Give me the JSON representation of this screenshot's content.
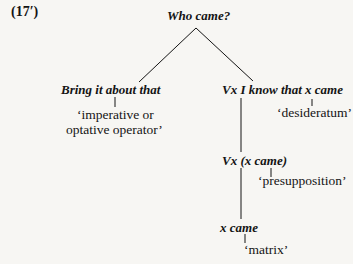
{
  "example_label": "(17′)",
  "tree": {
    "root": {
      "text": "Who came?"
    },
    "left": {
      "node": "Bring it about that",
      "gloss_line1": "‘imperative or",
      "gloss_line2": "optative operator’"
    },
    "right": {
      "node": "Vx I know that x came",
      "gloss": "‘desideratum’",
      "child": {
        "node": "Vx (x came)",
        "gloss": "‘presupposition’",
        "child": {
          "node": "x came",
          "gloss": "‘matrix’"
        }
      }
    }
  },
  "colors": {
    "background": "#f7f6f3",
    "ink": "#141414"
  }
}
